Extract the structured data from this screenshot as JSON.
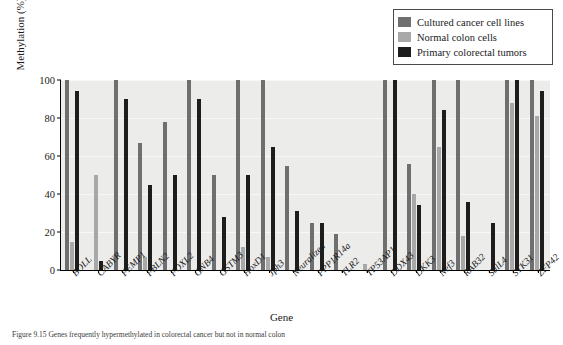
{
  "chart_data": {
    "type": "bar",
    "title": "",
    "xlabel": "Gene",
    "ylabel": "Methylation (%)",
    "ylim": [
      0,
      100
    ],
    "yticks": [
      0,
      20,
      40,
      60,
      80,
      100
    ],
    "grid": true,
    "legend_position": "top-right",
    "categories": [
      "BOLL",
      "CABYR",
      "FEMP1",
      "FBLN2",
      "FOXL2",
      "GNB4",
      "GSTM3",
      "HoxD1",
      "Jph3",
      "Neuralized",
      "PPP1R14a",
      "TLR2",
      "TP53AP1",
      "DDX43",
      "DKK3",
      "Nef3",
      "RAB32",
      "SalL4",
      "STK31",
      "ZFP42"
    ],
    "series": [
      {
        "name": "Cultured cancer cell lines",
        "color": "#6f6f6f",
        "values": [
          100,
          0,
          100,
          67,
          78,
          100,
          50,
          100,
          100,
          55,
          25,
          19,
          0,
          100,
          56,
          100,
          100,
          0,
          100,
          100
        ]
      },
      {
        "name": "Normal colon cells",
        "color": "#a8a8a8",
        "values": [
          15,
          50,
          0,
          7,
          0,
          0,
          0,
          12,
          7,
          0,
          0,
          0,
          3,
          0,
          40,
          65,
          18,
          0,
          88,
          81
        ]
      },
      {
        "name": "Primary colorectal tumors",
        "color": "#1d1d1d",
        "values": [
          94,
          5,
          90,
          45,
          50,
          90,
          28,
          50,
          65,
          31,
          25,
          0,
          0,
          100,
          34,
          84,
          36,
          25,
          100,
          94
        ]
      }
    ]
  },
  "legend": {
    "items": [
      {
        "label": "Cultured cancer cell lines",
        "color": "#6f6f6f"
      },
      {
        "label": "Normal colon cells",
        "color": "#a8a8a8"
      },
      {
        "label": "Primary colorectal tumors",
        "color": "#1d1d1d"
      }
    ]
  },
  "axes": {
    "y_title": "Methylation (%)",
    "x_title": "Gene",
    "y_ticks": [
      "0",
      "20",
      "40",
      "60",
      "80",
      "100"
    ]
  },
  "caption": {
    "text": "Figure 9.15   Genes frequently hypermethylated in colorectal cancer but not in normal colon"
  }
}
